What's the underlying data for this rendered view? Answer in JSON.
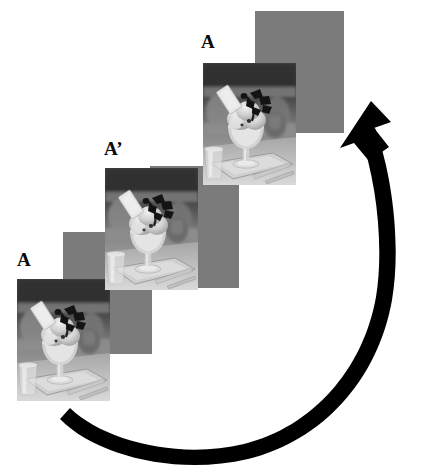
{
  "figure": {
    "type": "sequence-diagram",
    "background_color": "#ffffff",
    "width": 431,
    "height": 474,
    "placeholder_color": "#7b7b7b",
    "arrow_color": "#000000"
  },
  "labels": [
    {
      "id": "label-a-bottom",
      "text": "A",
      "x": 17,
      "y": 250
    },
    {
      "id": "label-a-prime",
      "text": "A’",
      "x": 104,
      "y": 139
    },
    {
      "id": "label-a-top",
      "text": "A",
      "x": 201,
      "y": 32
    }
  ],
  "cards": [
    {
      "id": "card-blank-bottom",
      "kind": "blank",
      "x": 63,
      "y": 232,
      "w": 89,
      "h": 122,
      "label": "blank placeholder frame lower"
    },
    {
      "id": "card-photo-bottom",
      "kind": "photo",
      "x": 17,
      "y": 279,
      "w": 93,
      "h": 122,
      "label": "ice cream sundae photo lower"
    },
    {
      "id": "card-blank-middle",
      "kind": "blank",
      "x": 150,
      "y": 166,
      "w": 89,
      "h": 122,
      "label": "blank placeholder frame middle"
    },
    {
      "id": "card-photo-middle",
      "kind": "photo",
      "x": 105,
      "y": 168,
      "w": 93,
      "h": 122,
      "label": "ice cream sundae photo middle"
    },
    {
      "id": "card-blank-top",
      "kind": "blank",
      "x": 255,
      "y": 11,
      "w": 89,
      "h": 122,
      "label": "blank placeholder frame upper"
    },
    {
      "id": "card-photo-top",
      "kind": "photo",
      "x": 203,
      "y": 63,
      "w": 93,
      "h": 122,
      "label": "ice cream sundae photo upper"
    }
  ],
  "arrow": {
    "id": "loop-arrow",
    "direction": "counterclockwise-loop-to-upper-right",
    "tail": {
      "x": 60,
      "y": 423
    },
    "head": {
      "x": 371,
      "y": 109
    },
    "color": "#000000"
  }
}
